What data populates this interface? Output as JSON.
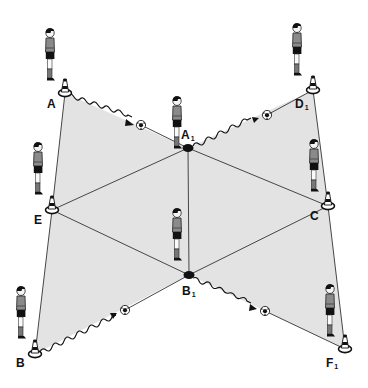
{
  "diagram": {
    "type": "football-training-drill",
    "colors": {
      "field_fill": "#e3e3e3",
      "line": "#333333",
      "dot": "#111111",
      "background": "#ffffff"
    },
    "stations": [
      {
        "id": "A",
        "label": "A",
        "sub": "",
        "marker": "cone",
        "x": 65,
        "y": 93
      },
      {
        "id": "D1",
        "label": "D",
        "sub": "1",
        "marker": "cone",
        "x": 313,
        "y": 90
      },
      {
        "id": "A1",
        "label": "A",
        "sub": "1",
        "marker": "dot",
        "x": 188,
        "y": 148
      },
      {
        "id": "E",
        "label": "E",
        "sub": "",
        "marker": "cone",
        "x": 52,
        "y": 210
      },
      {
        "id": "C",
        "label": "C",
        "sub": "",
        "marker": "cone",
        "x": 328,
        "y": 206
      },
      {
        "id": "B1",
        "label": "B",
        "sub": "1",
        "marker": "dot",
        "x": 189,
        "y": 275
      },
      {
        "id": "B",
        "label": "B",
        "sub": "",
        "marker": "cone",
        "x": 35,
        "y": 354
      },
      {
        "id": "F1",
        "label": "F",
        "sub": "1",
        "marker": "cone",
        "x": 345,
        "y": 349
      }
    ],
    "passes": [
      {
        "from": "A",
        "to": "A1",
        "style": "dribble",
        "ball": {
          "x": 141,
          "y": 125
        }
      },
      {
        "from": "A1",
        "to": "D1",
        "style": "dribble",
        "ball": {
          "x": 267,
          "y": 115
        }
      },
      {
        "from": "B",
        "to": "B1",
        "style": "dribble",
        "ball": {
          "x": 125,
          "y": 310
        }
      },
      {
        "from": "B1",
        "to": "F1",
        "style": "dribble",
        "ball": {
          "x": 265,
          "y": 311
        }
      }
    ],
    "players": [
      {
        "near": "A",
        "x": 50,
        "y": 28
      },
      {
        "near": "A1",
        "x": 176,
        "y": 80
      },
      {
        "near": "D1",
        "x": 297,
        "y": 23
      },
      {
        "near": "E",
        "x": 38,
        "y": 142
      },
      {
        "near": "C",
        "x": 314,
        "y": 139
      },
      {
        "near": "B1",
        "x": 177,
        "y": 208
      },
      {
        "near": "B",
        "x": 21,
        "y": 286
      },
      {
        "near": "F1",
        "x": 330,
        "y": 284
      }
    ]
  }
}
